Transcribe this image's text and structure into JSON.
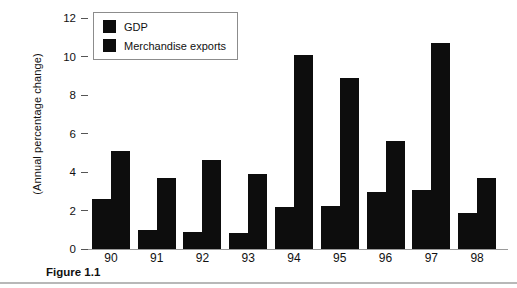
{
  "figure": {
    "caption": "Figure 1.1"
  },
  "legend": {
    "position": "top-left-inside",
    "items": [
      {
        "label": "GDP",
        "color": "#0d0d0d"
      },
      {
        "label": "Merchandise exports",
        "color": "#0d0d0d"
      }
    ]
  },
  "axes": {
    "y_title": "(Annual percentage change)",
    "y_ticks": [
      "0",
      "2",
      "4",
      "6",
      "8",
      "10",
      "12"
    ],
    "x_ticks": [
      "90",
      "91",
      "92",
      "93",
      "94",
      "95",
      "96",
      "97",
      "98"
    ]
  },
  "chart_data": {
    "type": "bar",
    "title": "",
    "xlabel": "",
    "ylabel": "(Annual percentage change)",
    "categories": [
      "90",
      "91",
      "92",
      "93",
      "94",
      "95",
      "96",
      "97",
      "98"
    ],
    "series": [
      {
        "name": "GDP",
        "color": "#0d0d0d",
        "values": [
          2.6,
          1.0,
          0.9,
          0.85,
          2.2,
          2.25,
          2.95,
          3.05,
          1.85
        ]
      },
      {
        "name": "Merchandise exports",
        "color": "#0d0d0d",
        "values": [
          5.1,
          3.7,
          4.6,
          3.9,
          10.1,
          8.9,
          5.6,
          10.7,
          3.7
        ]
      }
    ],
    "ylim": [
      0,
      12
    ],
    "ytick_step": 2,
    "grid": false,
    "legend_position": "top-left-inside"
  }
}
